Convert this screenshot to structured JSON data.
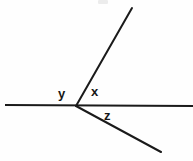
{
  "canvas": {
    "width": 193,
    "height": 161,
    "background_color": "#fefefe",
    "stroke_color": "#1a1a1a",
    "label_color": "#161616"
  },
  "figure": {
    "type": "angle-diagram",
    "vertex": {
      "x": 76,
      "y": 106
    },
    "strokes": [
      {
        "name": "horizontal-line",
        "x1": 5,
        "y1": 105,
        "x2": 193,
        "y2": 106,
        "width": 2.2
      },
      {
        "name": "upper-ray",
        "x1": 76,
        "y1": 106,
        "x2": 132,
        "y2": 8,
        "width": 2.0
      },
      {
        "name": "lower-right-ray",
        "x1": 76,
        "y1": 106,
        "x2": 161,
        "y2": 152,
        "width": 2.0
      }
    ]
  },
  "labels": {
    "y": "y",
    "x": "x",
    "z": "z"
  },
  "chart_data": {
    "type": "diagram",
    "title": "",
    "annotations": [
      {
        "text": "y",
        "x": 62,
        "y": 93,
        "meaning": "angle between left horizontal ray and upper ray"
      },
      {
        "text": "x",
        "x": 95,
        "y": 91,
        "meaning": "angle between upper ray and right horizontal ray"
      },
      {
        "text": "z",
        "x": 109,
        "y": 115,
        "meaning": "angle between right horizontal ray and lower-right ray"
      }
    ]
  }
}
